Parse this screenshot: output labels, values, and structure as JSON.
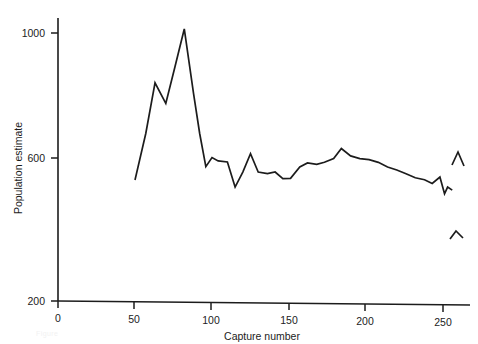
{
  "figure": {
    "caption": "Figure"
  },
  "chart_data": {
    "type": "line",
    "title": "",
    "xlabel": "Capture number",
    "ylabel": "Population estimate",
    "xlim": [
      0,
      262
    ],
    "ylim": [
      200,
      1060
    ],
    "grid": false,
    "legend": null,
    "x_ticks": [
      0,
      50,
      100,
      150,
      200,
      250
    ],
    "y_ticks": [
      200,
      600,
      1000
    ],
    "series": [
      {
        "name": "Population estimate",
        "x": [
          50,
          57,
          63,
          70,
          76,
          82,
          88,
          92,
          96,
          100,
          104,
          110,
          115,
          120,
          125,
          130,
          136,
          141,
          146,
          151,
          157,
          162,
          168,
          173,
          179,
          184,
          190,
          196,
          202,
          208,
          214,
          220,
          226,
          232,
          238,
          243,
          248,
          251,
          253,
          256
        ],
        "y": [
          561,
          700,
          851,
          790,
          900,
          1012,
          820,
          700,
          601,
          628,
          618,
          615,
          540,
          585,
          640,
          585,
          580,
          585,
          565,
          566,
          600,
          612,
          608,
          614,
          625,
          655,
          633,
          625,
          622,
          614,
          600,
          591,
          580,
          568,
          562,
          551,
          570,
          520,
          540,
          531
        ]
      }
    ],
    "artifact_marks": [
      {
        "name": "caret-upper",
        "points": [
          [
            452,
            165
          ],
          [
            458,
            152
          ],
          [
            464,
            166
          ]
        ]
      },
      {
        "name": "caret-lower",
        "points": [
          [
            450,
            239
          ],
          [
            456,
            231
          ],
          [
            463,
            238
          ]
        ]
      }
    ]
  }
}
